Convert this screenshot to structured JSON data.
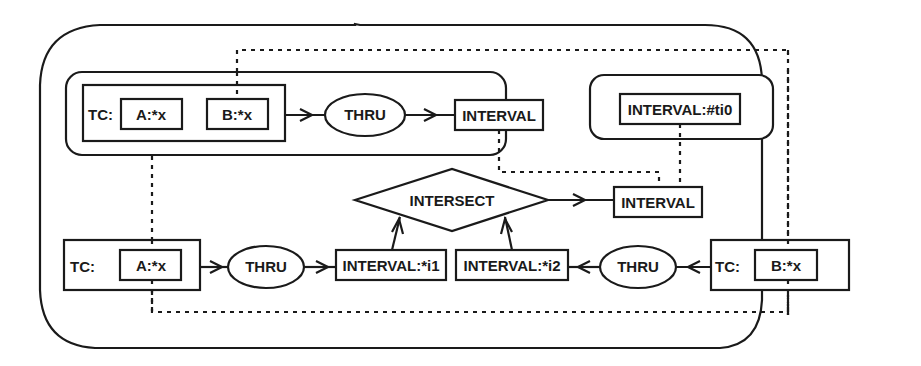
{
  "diagram": {
    "type": "conceptual-graph",
    "top_graph": {
      "context_label": "TC:",
      "concepts": [
        "A:*x",
        "B:*x"
      ],
      "relation": "THRU",
      "result": "INTERVAL"
    },
    "coreferent_box": {
      "label": "INTERVAL:#ti0"
    },
    "middle": {
      "relation": "INTERSECT",
      "result": "INTERVAL"
    },
    "bottom_left": {
      "context_label": "TC:",
      "concept": "A:*x",
      "relation": "THRU",
      "result": "INTERVAL:*i1"
    },
    "bottom_right": {
      "context_label": "TC:",
      "concept": "B:*x",
      "relation": "THRU",
      "result": "INTERVAL:*i2"
    },
    "edges": [
      {
        "from": "top.TC",
        "to": "top.THRU",
        "style": "solid-arrow"
      },
      {
        "from": "top.THRU",
        "to": "top.INTERVAL",
        "style": "solid-arrow"
      },
      {
        "from": "INTERSECT",
        "to": "middle.INTERVAL",
        "style": "solid-arrow"
      },
      {
        "from": "INTERVAL:*i1",
        "to": "INTERSECT",
        "style": "solid-arrow"
      },
      {
        "from": "INTERVAL:*i2",
        "to": "INTERSECT",
        "style": "solid-arrow"
      },
      {
        "from": "bottom_left.TC",
        "to": "bottom_left.THRU",
        "style": "solid-arrow"
      },
      {
        "from": "bottom_left.THRU",
        "to": "INTERVAL:*i1",
        "style": "solid-arrow"
      },
      {
        "from": "bottom_right.TC",
        "to": "bottom_right.THRU",
        "style": "solid-arrow"
      },
      {
        "from": "bottom_right.THRU",
        "to": "INTERVAL:*i2",
        "style": "solid-arrow"
      },
      {
        "from": "top.A:*x",
        "to": "bottom_left.A:*x",
        "style": "dotted-coreference"
      },
      {
        "from": "top.B:*x",
        "to": "bottom_right.B:*x",
        "style": "dotted-coreference"
      },
      {
        "from": "top.INTERVAL",
        "to": "middle.INTERVAL",
        "style": "dotted-coreference"
      },
      {
        "from": "INTERVAL:#ti0",
        "to": "middle.INTERVAL",
        "style": "dotted-coreference"
      }
    ]
  }
}
